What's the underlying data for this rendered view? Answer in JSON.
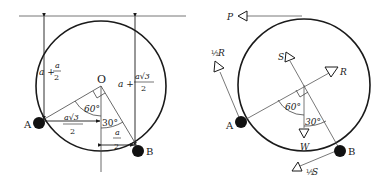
{
  "left_figure": {
    "center_label": "O",
    "point_a_label": "A",
    "point_b_label": "B",
    "angle_a_label": "60°",
    "angle_b_label": "30°",
    "height_a": {
      "prefix": "a + ",
      "num": "a",
      "den": "2"
    },
    "height_b": {
      "prefix": "a + ",
      "num": "a√3",
      "den": "2"
    },
    "horiz_a": {
      "num": "a√3",
      "den": "2"
    },
    "horiz_b": {
      "num": "a",
      "den": "2"
    }
  },
  "right_figure": {
    "point_a_label": "A",
    "point_b_label": "B",
    "angle_a_label": "60°",
    "angle_b_label": "30°",
    "forces": {
      "P": "P",
      "half_R": {
        "frac": "½",
        "sym": "R"
      },
      "S": "S",
      "R": "R",
      "W": "W",
      "half_S": {
        "frac": "½",
        "sym": "S"
      }
    }
  },
  "colors": {
    "ink": "#1a1a1a",
    "line": "#555555"
  }
}
